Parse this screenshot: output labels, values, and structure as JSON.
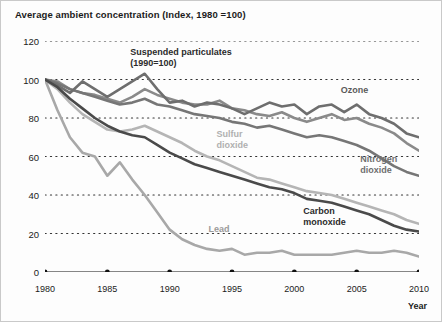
{
  "title": "Average ambient concentration (Index, 1980 =100)",
  "axis": {
    "x_title": "Year",
    "x_ticks": [
      "1980",
      "1985",
      "1990",
      "1995",
      "2000",
      "2005",
      "2010"
    ],
    "y_ticks": [
      "120",
      "100",
      "80",
      "60",
      "40",
      "20",
      "0"
    ]
  },
  "labels": {
    "suspended": "Suspended particulates\n(1990=100)",
    "ozone": "Ozone",
    "sulfur": "Sulfur\ndioxide",
    "nitrogen": "Nitrogen\ndioxide",
    "carbon": "Carbon\nmonoxide",
    "lead": "Lead"
  },
  "colors": {
    "suspended": "#8a8a8a",
    "ozone": "#6e6e6e",
    "sulfur": "#b5b5b5",
    "nitrogen": "#767676",
    "carbon": "#4a4a4a",
    "lead": "#a8a8a8",
    "grid": "#333333",
    "axis": "#111111",
    "text": "#1b1b1b"
  },
  "chart_data": {
    "type": "line",
    "title": "Average ambient concentration (Index, 1980 =100)",
    "xlabel": "Year",
    "ylabel": "",
    "xlim": [
      1980,
      2010
    ],
    "ylim": [
      0,
      120
    ],
    "grid": true,
    "legend": "inline-annotations",
    "x": [
      1980,
      1981,
      1982,
      1983,
      1984,
      1985,
      1986,
      1987,
      1988,
      1989,
      1990,
      1991,
      1992,
      1993,
      1994,
      1995,
      1996,
      1997,
      1998,
      1999,
      2000,
      2001,
      2002,
      2003,
      2004,
      2005,
      2006,
      2007,
      2008,
      2009,
      2010
    ],
    "series": [
      {
        "name": "Ozone",
        "color": "#6e6e6e",
        "values": [
          100,
          97,
          93,
          99,
          95,
          91,
          95,
          99,
          103,
          95,
          88,
          89,
          86,
          88,
          87,
          85,
          82,
          85,
          88,
          86,
          87,
          82,
          86,
          87,
          83,
          87,
          82,
          80,
          77,
          72,
          70
        ]
      },
      {
        "name": "Suspended particulates (1990=100)",
        "color": "#8a8a8a",
        "values": [
          100,
          99,
          95,
          93,
          92,
          90,
          88,
          91,
          95,
          92,
          90,
          88,
          87,
          87,
          89,
          85,
          84,
          82,
          81,
          83,
          80,
          78,
          80,
          82,
          79,
          80,
          77,
          75,
          72,
          67,
          63
        ]
      },
      {
        "name": "Nitrogen dioxide",
        "color": "#767676",
        "values": [
          100,
          98,
          95,
          93,
          91,
          89,
          87,
          88,
          90,
          87,
          86,
          84,
          82,
          81,
          80,
          78,
          77,
          75,
          76,
          74,
          72,
          70,
          71,
          70,
          68,
          66,
          63,
          59,
          55,
          52,
          50
        ]
      },
      {
        "name": "Sulfur dioxide",
        "color": "#b5b5b5",
        "values": [
          100,
          95,
          88,
          82,
          78,
          74,
          73,
          74,
          76,
          73,
          70,
          67,
          63,
          60,
          58,
          55,
          52,
          49,
          48,
          46,
          44,
          42,
          41,
          40,
          38,
          36,
          34,
          32,
          30,
          27,
          25
        ]
      },
      {
        "name": "Carbon monoxide",
        "color": "#4a4a4a",
        "values": [
          100,
          96,
          90,
          85,
          80,
          76,
          73,
          71,
          70,
          66,
          62,
          59,
          56,
          54,
          52,
          50,
          48,
          46,
          44,
          43,
          41,
          38,
          37,
          36,
          34,
          32,
          30,
          27,
          24,
          22,
          21
        ]
      },
      {
        "name": "Lead",
        "color": "#a8a8a8",
        "values": [
          100,
          84,
          70,
          62,
          60,
          50,
          57,
          48,
          40,
          31,
          22,
          17,
          14,
          12,
          11,
          12,
          9,
          10,
          10,
          11,
          9,
          9,
          9,
          9,
          10,
          11,
          10,
          10,
          11,
          10,
          8
        ]
      }
    ]
  }
}
